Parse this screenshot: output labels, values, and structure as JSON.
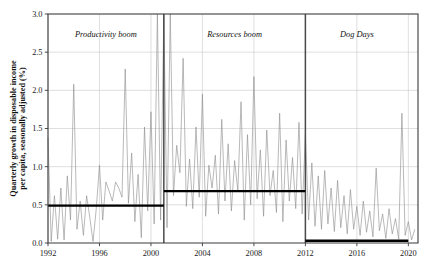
{
  "chart_data": {
    "type": "line",
    "title": "",
    "xlabel": "",
    "ylabel": "Quarterly growth in disposable income per capita, seasonally adjusted (%)",
    "xlim": [
      1992.0,
      2020.75
    ],
    "ylim": [
      0.0,
      3.0
    ],
    "grid": true,
    "legend": "none",
    "yticks": [
      "0.0",
      "0.5",
      "1.0",
      "1.5",
      "2.0",
      "2.5",
      "3.0"
    ],
    "ytick_values": [
      0.0,
      0.5,
      1.0,
      1.5,
      2.0,
      2.5,
      3.0
    ],
    "xticks": [
      "1992",
      "1996",
      "2000",
      "2004",
      "2008",
      "2012",
      "2016",
      "2020"
    ],
    "xtick_values": [
      1992,
      1996,
      2000,
      2004,
      2008,
      2012,
      2016,
      2020
    ],
    "series": [
      {
        "name": "Quarterly growth in disposable income per capita",
        "x": [
          1992.0,
          1992.25,
          1992.5,
          1992.75,
          1993.0,
          1993.25,
          1993.5,
          1993.75,
          1994.0,
          1994.25,
          1994.5,
          1994.75,
          1995.0,
          1995.25,
          1995.5,
          1995.75,
          1996.0,
          1996.25,
          1996.5,
          1996.75,
          1997.0,
          1997.25,
          1997.5,
          1997.75,
          1998.0,
          1998.25,
          1998.5,
          1998.75,
          1999.0,
          1999.25,
          1999.5,
          1999.75,
          2000.0,
          2000.25,
          2000.5,
          2000.75,
          2001.0,
          2001.25,
          2001.5,
          2001.75,
          2002.0,
          2002.25,
          2002.5,
          2002.75,
          2003.0,
          2003.25,
          2003.5,
          2003.75,
          2004.0,
          2004.25,
          2004.5,
          2004.75,
          2005.0,
          2005.25,
          2005.5,
          2005.75,
          2006.0,
          2006.25,
          2006.5,
          2006.75,
          2007.0,
          2007.25,
          2007.5,
          2007.75,
          2008.0,
          2008.25,
          2008.5,
          2008.75,
          2009.0,
          2009.25,
          2009.5,
          2009.75,
          2010.0,
          2010.25,
          2010.5,
          2010.75,
          2011.0,
          2011.25,
          2011.5,
          2011.75,
          2012.0,
          2012.25,
          2012.5,
          2012.75,
          2013.0,
          2013.25,
          2013.5,
          2013.75,
          2014.0,
          2014.25,
          2014.5,
          2014.75,
          2015.0,
          2015.25,
          2015.5,
          2015.75,
          2016.0,
          2016.25,
          2016.5,
          2016.75,
          2017.0,
          2017.25,
          2017.5,
          2017.75,
          2018.0,
          2018.25,
          2018.5,
          2018.75,
          2019.0,
          2019.25,
          2019.5,
          2019.75,
          2020.0,
          2020.25,
          2020.5
        ],
        "y": [
          1.38,
          0.02,
          0.62,
          0.05,
          0.72,
          0.04,
          0.88,
          0.3,
          2.08,
          0.18,
          0.55,
          0.1,
          0.62,
          0.33,
          0.02,
          0.45,
          1.02,
          0.3,
          0.8,
          0.68,
          0.55,
          0.8,
          0.72,
          0.6,
          2.28,
          0.52,
          1.18,
          0.28,
          0.9,
          0.07,
          1.52,
          0.42,
          1.72,
          0.25,
          3.0,
          0.3,
          3.0,
          0.2,
          3.0,
          0.62,
          1.28,
          0.92,
          2.42,
          0.48,
          1.1,
          0.45,
          1.52,
          0.6,
          1.95,
          0.35,
          1.02,
          0.72,
          1.15,
          0.38,
          1.62,
          0.55,
          1.3,
          0.42,
          1.08,
          0.68,
          1.85,
          0.3,
          1.42,
          0.5,
          2.18,
          0.58,
          1.22,
          0.35,
          1.48,
          0.62,
          0.95,
          0.4,
          1.7,
          0.28,
          1.35,
          0.55,
          1.12,
          0.45,
          1.58,
          0.38,
          1.42,
          0.3,
          1.05,
          0.22,
          0.88,
          0.18,
          0.95,
          0.25,
          0.72,
          0.15,
          0.82,
          0.2,
          0.62,
          0.12,
          0.7,
          0.18,
          0.48,
          0.1,
          0.55,
          0.14,
          0.42,
          0.08,
          0.98,
          0.16,
          0.38,
          0.06,
          0.45,
          0.12,
          0.32,
          0.05,
          1.7,
          0.1,
          0.28,
          0.04,
          0.18
        ]
      }
    ],
    "periods": [
      {
        "label": "Productivity boom",
        "start": 1992.0,
        "end": 2001.0,
        "mean": 0.49
      },
      {
        "label": "Resources boom",
        "start": 2001.0,
        "end": 2012.0,
        "mean": 0.68
      },
      {
        "label": "Dog Days",
        "start": 2012.0,
        "end": 2020.0,
        "mean": 0.03
      }
    ],
    "dividers": [
      2001.0,
      2012.0
    ]
  }
}
